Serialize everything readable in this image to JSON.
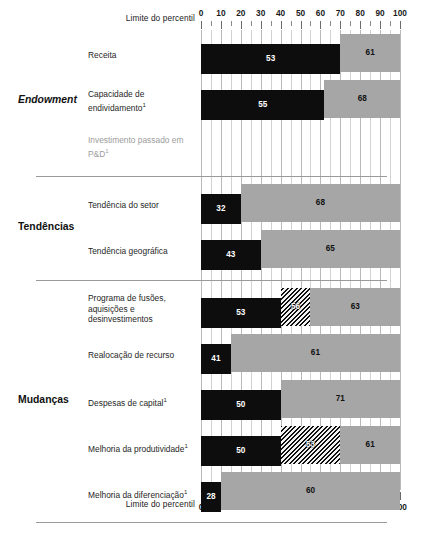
{
  "chart_data": {
    "type": "bar",
    "title": "",
    "subtitle": "",
    "xlabel": "Limite do percentil",
    "ylabel": "",
    "xlim": [
      0,
      100
    ],
    "grid": true,
    "grid_step": 5,
    "legend_position": "none",
    "axis_caption": "Limite do percentil",
    "tick_labels": [
      "0",
      "10",
      "20",
      "30",
      "40",
      "50",
      "60",
      "70",
      "80",
      "90",
      "100"
    ],
    "tick_values": [
      0,
      10,
      20,
      30,
      40,
      50,
      60,
      70,
      80,
      90,
      100
    ],
    "minor_tick_step": 5,
    "colors": {
      "black_segment": "#0d0d0d",
      "gray_segment": "#a6a6a6",
      "hatch_segment": "#111111",
      "grid_line": "#d2d2d2",
      "rule": "#9a9a9a",
      "dim_text": "#9d9d9d"
    },
    "sections": [
      {
        "name": "Endowment",
        "style": "italic",
        "rows": [
          {
            "label": "Receita",
            "dimmed": false,
            "segments": [
              {
                "kind": "black",
                "start": 0,
                "end": 70,
                "value": "53"
              },
              {
                "kind": "gray",
                "start": 70,
                "end": 100,
                "value": "61"
              }
            ]
          },
          {
            "label": "Capacidade de endividamento",
            "footnote": "1",
            "dimmed": false,
            "segments": [
              {
                "kind": "black",
                "start": 0,
                "end": 62,
                "value": "55"
              },
              {
                "kind": "gray",
                "start": 62,
                "end": 100,
                "value": "68"
              }
            ]
          },
          {
            "label": "Investimento passado em P&D",
            "footnote": "1",
            "dimmed": true,
            "segments": []
          }
        ]
      },
      {
        "name": "Tendências",
        "style": "normal",
        "rows": [
          {
            "label": "Tendência do setor",
            "dimmed": false,
            "segments": [
              {
                "kind": "black",
                "start": 0,
                "end": 20,
                "value": "32"
              },
              {
                "kind": "gray",
                "start": 20,
                "end": 100,
                "value": "68"
              }
            ]
          },
          {
            "label": "Tendência geográfica",
            "dimmed": false,
            "segments": [
              {
                "kind": "black",
                "start": 0,
                "end": 30,
                "value": "43"
              },
              {
                "kind": "gray",
                "start": 30,
                "end": 100,
                "value": "65"
              }
            ]
          }
        ]
      },
      {
        "name": "Mudanças",
        "style": "normal",
        "rows": [
          {
            "label": "Programa de fusões, aquisições e desinvestimentos",
            "dimmed": false,
            "segments": [
              {
                "kind": "black",
                "start": 0,
                "end": 40,
                "value": "53"
              },
              {
                "kind": "hatch",
                "start": 40,
                "end": 55,
                "value": "56"
              },
              {
                "kind": "gray",
                "start": 55,
                "end": 100,
                "value": "63"
              }
            ]
          },
          {
            "label": "Realocação de recurso",
            "dimmed": false,
            "segments": [
              {
                "kind": "black",
                "start": 0,
                "end": 15,
                "value": "41"
              },
              {
                "kind": "gray",
                "start": 15,
                "end": 100,
                "value": "61"
              }
            ]
          },
          {
            "label": "Despesas de capital",
            "footnote": "1",
            "dimmed": false,
            "segments": [
              {
                "kind": "black",
                "start": 0,
                "end": 40,
                "value": "50"
              },
              {
                "kind": "gray",
                "start": 40,
                "end": 100,
                "value": "71"
              }
            ]
          },
          {
            "label": "Melhoria da produtividade",
            "footnote": "1",
            "dimmed": false,
            "segments": [
              {
                "kind": "black",
                "start": 0,
                "end": 40,
                "value": "50"
              },
              {
                "kind": "hatch",
                "start": 40,
                "end": 70,
                "value": "53"
              },
              {
                "kind": "gray",
                "start": 70,
                "end": 100,
                "value": "61"
              }
            ]
          },
          {
            "label": "Melhoria da diferenciação",
            "footnote": "1",
            "dimmed": false,
            "segments": [
              {
                "kind": "black",
                "start": 0,
                "end": 10,
                "value": "28"
              },
              {
                "kind": "gray",
                "start": 10,
                "end": 100,
                "value": "60"
              }
            ]
          }
        ]
      }
    ]
  }
}
